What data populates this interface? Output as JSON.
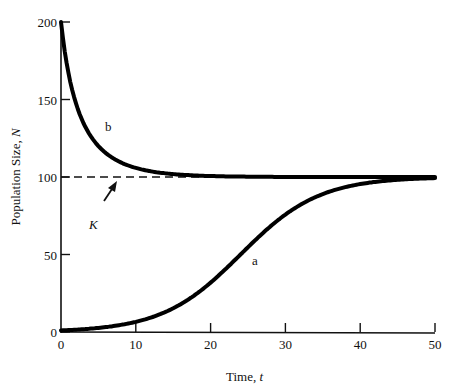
{
  "chart_data": {
    "type": "line",
    "title": "",
    "xlabel": "Time, t",
    "xlabel_main": "Time, ",
    "xlabel_var": "t",
    "ylabel": "Population Size, N",
    "ylabel_main": "Population Size, ",
    "ylabel_var": "N",
    "xlim": [
      0,
      50
    ],
    "ylim": [
      0,
      200
    ],
    "xticks": [
      0,
      10,
      20,
      30,
      40,
      50
    ],
    "yticks": [
      0,
      50,
      100,
      150,
      200
    ],
    "xtick_labels": [
      "0",
      "10",
      "20",
      "30",
      "40",
      "50"
    ],
    "ytick_labels": [
      "0",
      "50",
      "100",
      "150",
      "200"
    ],
    "grid": false,
    "legend": "none",
    "x": [
      0,
      2,
      4,
      6,
      8,
      10,
      12,
      14,
      16,
      18,
      20,
      22,
      24,
      26,
      28,
      30,
      32,
      34,
      36,
      38,
      40,
      42,
      44,
      46,
      48,
      50
    ],
    "series": [
      {
        "name": "a",
        "description": "logistic growth from small N0 (approx N0=1, K=100, r~0.19)",
        "values": [
          1.0,
          1.5,
          2.2,
          3.1,
          4.5,
          6.5,
          9.3,
          13.0,
          18.0,
          24.2,
          31.9,
          40.6,
          50.0,
          59.4,
          68.1,
          75.8,
          82.0,
          87.0,
          90.7,
          93.5,
          95.5,
          96.9,
          97.8,
          98.5,
          99.0,
          99.3
        ]
      },
      {
        "name": "b",
        "description": "logistic decline from N0=200 toward K=100 (r~0.22)",
        "values": [
          200.0,
          147.0,
          126.2,
          116.3,
          110.5,
          107.2,
          104.2,
          102.6,
          101.5,
          100.9,
          100.6,
          100.3,
          100.2,
          100.1,
          100.1,
          100.0,
          100.0,
          100.0,
          100.0,
          100.0,
          100.0,
          100.0,
          100.0,
          100.0,
          100.0,
          100.0
        ]
      },
      {
        "name": "K",
        "style": "dashed",
        "description": "carrying capacity",
        "values_const": 100,
        "x_range": [
          0,
          20
        ]
      }
    ],
    "annotations": [
      {
        "text": "a",
        "x": 26,
        "y": 45
      },
      {
        "text": "b",
        "x": 6.5,
        "y": 132
      },
      {
        "text": "K",
        "x": 4.5,
        "y": 68,
        "arrow_to": [
          7.5,
          98
        ]
      }
    ]
  }
}
